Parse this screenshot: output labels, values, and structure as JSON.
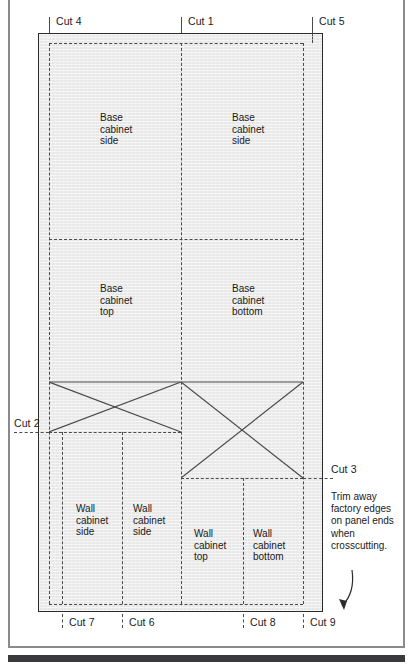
{
  "figure": {
    "panel": {
      "fill_color": "#e8e8e8",
      "border_color": "#2b2b2b",
      "cut_line_color": "#4a4a4a"
    }
  },
  "cut_labels": {
    "top": [
      {
        "id": "cut-4",
        "text": "Cut 4",
        "x": 49
      },
      {
        "id": "cut-1",
        "text": "Cut 1",
        "x": 181
      },
      {
        "id": "cut-5",
        "text": "Cut 5",
        "x": 312
      }
    ],
    "bottom": [
      {
        "id": "cut-7",
        "text": "Cut 7",
        "x": 62
      },
      {
        "id": "cut-6",
        "text": "Cut 6",
        "x": 122
      },
      {
        "id": "cut-8",
        "text": "Cut 8",
        "x": 243
      },
      {
        "id": "cut-9",
        "text": "Cut 9",
        "x": 303
      }
    ],
    "left": [
      {
        "id": "cut-2",
        "text": "Cut 2",
        "y": 432
      }
    ],
    "right": [
      {
        "id": "cut-3",
        "text": "Cut 3",
        "y": 478
      }
    ]
  },
  "parts": [
    {
      "id": "base-cabinet-side-left",
      "line1": "Base",
      "line2": "cabinet",
      "line3": "side"
    },
    {
      "id": "base-cabinet-side-right",
      "line1": "Base",
      "line2": "cabinet",
      "line3": "side"
    },
    {
      "id": "base-cabinet-top",
      "line1": "Base",
      "line2": "cabinet",
      "line3": "top"
    },
    {
      "id": "base-cabinet-bottom",
      "line1": "Base",
      "line2": "cabinet",
      "line3": "bottom"
    },
    {
      "id": "wall-cabinet-side-1",
      "line1": "Wall",
      "line2": "cabinet",
      "line3": "side"
    },
    {
      "id": "wall-cabinet-side-2",
      "line1": "Wall",
      "line2": "cabinet",
      "line3": "side"
    },
    {
      "id": "wall-cabinet-top",
      "line1": "Wall",
      "line2": "cabinet",
      "line3": "top"
    },
    {
      "id": "wall-cabinet-bottom",
      "line1": "Wall",
      "line2": "cabinet",
      "line3": "bottom"
    }
  ],
  "annotation": {
    "trim_note": "Trim away factory edges on panel ends when crosscutting."
  }
}
